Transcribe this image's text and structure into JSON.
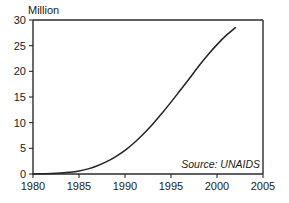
{
  "chart_data": {
    "type": "line",
    "title": "",
    "subtitle": "",
    "ylabel": "Million",
    "xlabel": "",
    "xlim": [
      1980,
      2005
    ],
    "ylim": [
      0,
      30
    ],
    "grid": false,
    "legend": false,
    "annotations": [
      {
        "name": "source",
        "text": "Source: UNAIDS",
        "x": 2001.5,
        "y": 3.2
      }
    ],
    "xticks": [
      "1980",
      "1985",
      "1990",
      "1995",
      "2000",
      "2005"
    ],
    "xtick_values": [
      1980,
      1985,
      1990,
      1995,
      2000,
      2005
    ],
    "yticks": [
      "0",
      "5",
      "10",
      "15",
      "20",
      "25",
      "30"
    ],
    "ytick_values": [
      0,
      5,
      10,
      15,
      20,
      25,
      30
    ],
    "series": [
      {
        "name": "People living with HIV/AIDS",
        "color": "#232323",
        "x": [
          1980,
          1981,
          1982,
          1983,
          1984,
          1985,
          1986,
          1987,
          1988,
          1989,
          1990,
          1991,
          1992,
          1993,
          1994,
          1995,
          1996,
          1997,
          1998,
          1999,
          2000,
          2001,
          2002
        ],
        "values": [
          0.0,
          0.05,
          0.1,
          0.2,
          0.35,
          0.6,
          1.0,
          1.6,
          2.4,
          3.4,
          4.6,
          6.1,
          7.8,
          9.7,
          11.8,
          14.0,
          16.3,
          18.6,
          21.0,
          23.2,
          25.2,
          27.0,
          28.5
        ]
      }
    ]
  },
  "axis": {
    "y_caption": "Million",
    "source_note": "Source: UNAIDS"
  },
  "colors": {
    "line": "#232323",
    "frame": "#2b2b2b",
    "text": "#1a1a1a",
    "background": "#ffffff"
  }
}
